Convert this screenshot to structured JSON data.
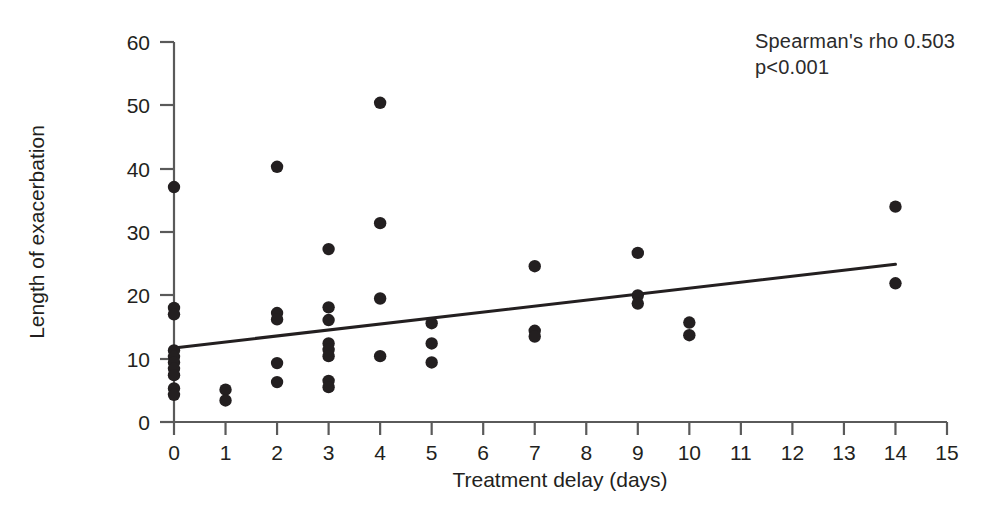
{
  "chart_data": {
    "type": "scatter",
    "title": "",
    "xlabel": "Treatment delay (days)",
    "ylabel": "Length of exacerbation",
    "xlim": [
      0,
      15
    ],
    "ylim": [
      0,
      60
    ],
    "xticks": [
      0,
      1,
      2,
      3,
      4,
      5,
      6,
      7,
      8,
      9,
      10,
      11,
      12,
      13,
      14,
      15
    ],
    "yticks": [
      0,
      10,
      20,
      30,
      40,
      50,
      60
    ],
    "xtick_labels": [
      "0",
      "1",
      "2",
      "3",
      "4",
      "5",
      "6",
      "7",
      "8",
      "9",
      "10",
      "11",
      "12",
      "13",
      "14",
      "15"
    ],
    "ytick_labels": [
      "0",
      "10",
      "20",
      "30",
      "40",
      "50",
      "60"
    ],
    "grid": false,
    "legend": null,
    "marker_color": "#231f20",
    "marker_size": 8,
    "points": [
      {
        "x": 0,
        "y": 37.1
      },
      {
        "x": 0,
        "y": 18.0
      },
      {
        "x": 0,
        "y": 17.0
      },
      {
        "x": 0,
        "y": 11.3
      },
      {
        "x": 0,
        "y": 10.3
      },
      {
        "x": 0,
        "y": 9.4
      },
      {
        "x": 0,
        "y": 8.4
      },
      {
        "x": 0,
        "y": 7.4
      },
      {
        "x": 0,
        "y": 5.3
      },
      {
        "x": 0,
        "y": 4.3
      },
      {
        "x": 1,
        "y": 5.1
      },
      {
        "x": 1,
        "y": 3.4
      },
      {
        "x": 2,
        "y": 40.3
      },
      {
        "x": 2,
        "y": 17.2
      },
      {
        "x": 2,
        "y": 16.2
      },
      {
        "x": 2,
        "y": 9.3
      },
      {
        "x": 2,
        "y": 6.3
      },
      {
        "x": 3,
        "y": 27.3
      },
      {
        "x": 3,
        "y": 18.1
      },
      {
        "x": 3,
        "y": 16.1
      },
      {
        "x": 3,
        "y": 12.4
      },
      {
        "x": 3,
        "y": 11.4
      },
      {
        "x": 3,
        "y": 10.4
      },
      {
        "x": 3,
        "y": 6.5
      },
      {
        "x": 3,
        "y": 5.5
      },
      {
        "x": 4,
        "y": 50.4
      },
      {
        "x": 4,
        "y": 31.4
      },
      {
        "x": 4,
        "y": 19.5
      },
      {
        "x": 4,
        "y": 10.4
      },
      {
        "x": 5,
        "y": 15.6
      },
      {
        "x": 5,
        "y": 12.4
      },
      {
        "x": 5,
        "y": 9.4
      },
      {
        "x": 7,
        "y": 24.6
      },
      {
        "x": 7,
        "y": 14.4
      },
      {
        "x": 7,
        "y": 13.5
      },
      {
        "x": 9,
        "y": 26.7
      },
      {
        "x": 9,
        "y": 20.0
      },
      {
        "x": 9,
        "y": 18.7
      },
      {
        "x": 10,
        "y": 15.7
      },
      {
        "x": 10,
        "y": 13.7
      },
      {
        "x": 14,
        "y": 34.0
      },
      {
        "x": 14,
        "y": 21.9
      }
    ],
    "trend_line": {
      "x_start": 0,
      "y_start": 11.7,
      "x_end": 14,
      "y_end": 24.9,
      "color": "#231f20",
      "width": 3
    },
    "annotations": {
      "spearman_rho": "Spearman's rho 0.503",
      "p_value": "p<0.001"
    }
  }
}
